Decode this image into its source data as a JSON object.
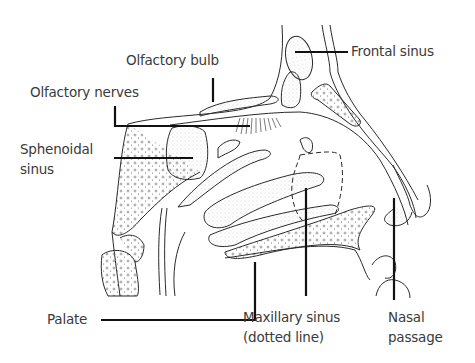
{
  "diagram": {
    "labels": {
      "olfactory_bulb": "Olfactory bulb",
      "olfactory_nerves": "Olfactory nerves",
      "sphenoidal_sinus_1": "Sphenoidal",
      "sphenoidal_sinus_2": "sinus",
      "frontal_sinus": "Frontal sinus",
      "palate": "Palate",
      "maxillary_sinus_1": "Maxillary sinus",
      "maxillary_sinus_2": "(dotted line)",
      "nasal_passage_1": "Nasal",
      "nasal_passage_2": "passage"
    },
    "colors": {
      "line": "#222222",
      "leader": "#111111",
      "text": "#3a3a3a",
      "stipple": "#888888"
    }
  }
}
